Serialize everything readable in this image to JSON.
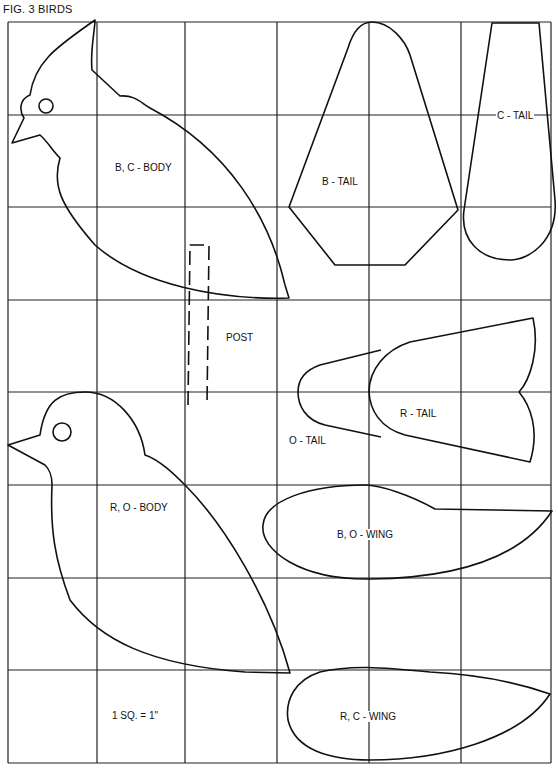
{
  "figure": {
    "title": "FIG. 3 BIRDS",
    "scale_note": "1 SQ. = 1\"",
    "grid": {
      "columns": 6,
      "rows": 8,
      "unit": "1 inch per square"
    }
  },
  "patterns": {
    "bc_body": "B, C - BODY",
    "b_tail": "B - TAIL",
    "c_tail": "C - TAIL",
    "post": "POST",
    "o_tail": "O - TAIL",
    "r_tail": "R - TAIL",
    "ro_body": "R, O - BODY",
    "bo_wing": "B, O - WING",
    "rc_wing": "R, C - WING"
  },
  "colors": {
    "line": "#111111",
    "background": "#ffffff"
  }
}
